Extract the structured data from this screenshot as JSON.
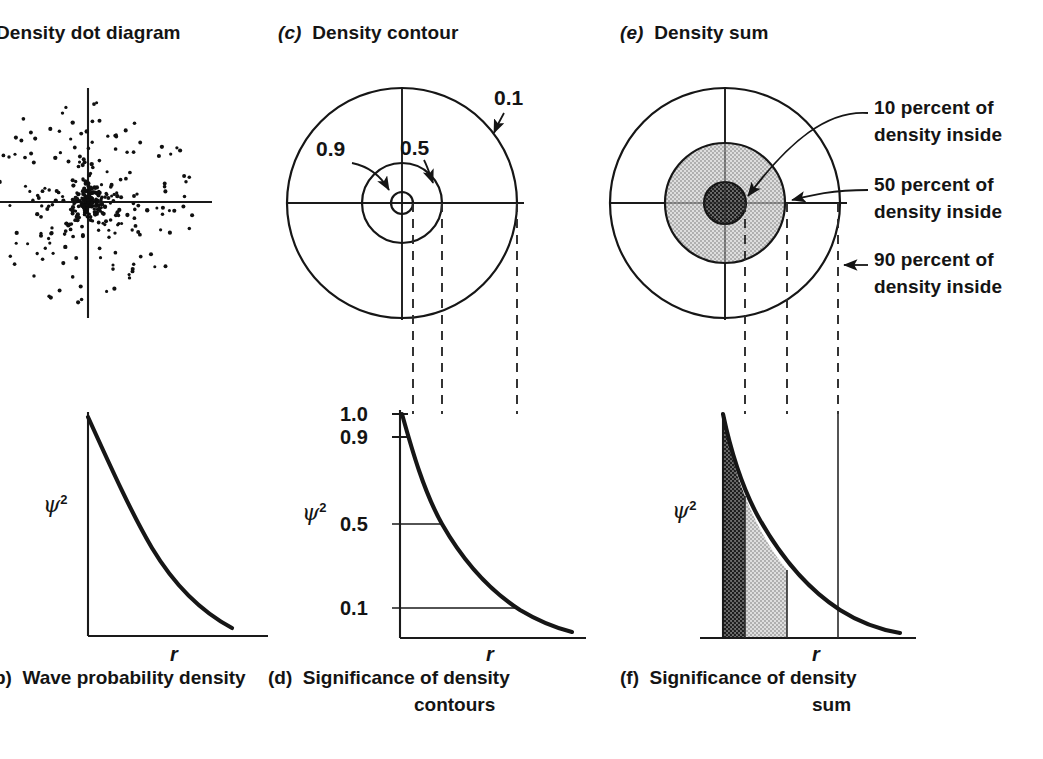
{
  "figure": {
    "panels": [
      {
        "id": "a",
        "tag": "",
        "title": "Density dot diagram",
        "position": "top-left",
        "clipped": true
      },
      {
        "id": "b",
        "tag": "b)",
        "title": "Wave probability density",
        "position": "bottom-left",
        "clipped": true
      },
      {
        "id": "c",
        "tag": "(c)",
        "title": "Density contour",
        "position": "top-middle"
      },
      {
        "id": "d",
        "tag": "(d)",
        "title": "Significance of density",
        "title2": "contours",
        "position": "bottom-middle"
      },
      {
        "id": "e",
        "tag": "(e)",
        "title": "Density sum",
        "position": "top-right"
      },
      {
        "id": "f",
        "tag": "(f)",
        "title": "Significance of density",
        "title2": "sum",
        "position": "bottom-right"
      }
    ]
  },
  "panel_a": {
    "title": "Density dot diagram",
    "axes": {
      "type": "crosshair"
    },
    "dots": {
      "description": "radially decaying random scatter",
      "count": 330
    }
  },
  "panel_b": {
    "tag": "b)",
    "caption": "Wave probability density",
    "y_axis_label": "ψ",
    "y_axis_exponent": "2",
    "x_axis_label": "r"
  },
  "panel_c": {
    "tag": "(c)",
    "title": "Density contour",
    "contour_labels": [
      "0.1",
      "0.5",
      "0.9"
    ],
    "axes": {
      "type": "crosshair"
    }
  },
  "panel_d": {
    "tag": "(d)",
    "caption_line1": "Significance of density",
    "caption_line2": "contours",
    "y_axis_label": "ψ",
    "y_axis_exponent": "2",
    "x_axis_label": "r",
    "y_ticks": [
      "1.0",
      "0.9",
      "0.5",
      "0.1"
    ]
  },
  "panel_e": {
    "tag": "(e)",
    "title": "Density sum",
    "annotations": [
      {
        "id": "inner",
        "line1": "10 percent of",
        "line2": "density inside"
      },
      {
        "id": "middle",
        "line1": "50 percent of",
        "line2": "density inside"
      },
      {
        "id": "outer",
        "line1": "90 percent of",
        "line2": "density inside"
      }
    ],
    "axes": {
      "type": "crosshair"
    }
  },
  "panel_f": {
    "tag": "(f)",
    "caption_line1": "Significance of density",
    "caption_line2": "sum",
    "y_axis_label": "ψ",
    "y_axis_exponent": "2",
    "x_axis_label": "r"
  },
  "chart_data": [
    {
      "type": "line",
      "id": "panel_b_curve",
      "title": "Wave probability density",
      "xlabel": "r",
      "ylabel": "psi^2",
      "grid": false,
      "legend": null,
      "x": [
        0,
        0.1,
        0.2,
        0.3,
        0.4,
        0.5,
        0.6,
        0.7,
        0.8,
        0.9,
        1.0
      ],
      "values": [
        1.0,
        0.78,
        0.6,
        0.46,
        0.35,
        0.27,
        0.2,
        0.15,
        0.11,
        0.08,
        0.06
      ],
      "note": "exponential decay psi^2 = exp(-k r)"
    },
    {
      "type": "line",
      "id": "panel_d_curve",
      "title": "Significance of density contours",
      "xlabel": "r",
      "ylabel": "psi^2",
      "grid": false,
      "ylim": [
        0,
        1.0
      ],
      "ytick_values": [
        1.0,
        0.9,
        0.5,
        0.1
      ],
      "ytick_labels": [
        "1.0",
        "0.9",
        "0.5",
        "0.1"
      ],
      "x": [
        0,
        0.1,
        0.2,
        0.3,
        0.4,
        0.5,
        0.6,
        0.7,
        0.8,
        0.9,
        1.0
      ],
      "values": [
        1.0,
        0.74,
        0.55,
        0.41,
        0.3,
        0.22,
        0.165,
        0.12,
        0.09,
        0.067,
        0.05
      ],
      "markers": [
        {
          "label": "0.9",
          "psi2": 0.9,
          "r_rel": 0.05
        },
        {
          "label": "0.5",
          "psi2": 0.5,
          "r_rel": 0.28
        },
        {
          "label": "0.1",
          "psi2": 0.1,
          "r_rel": 0.87
        }
      ]
    },
    {
      "type": "area",
      "id": "panel_f_curve",
      "title": "Significance of density sum",
      "xlabel": "r",
      "ylabel": "psi^2",
      "grid": false,
      "x": [
        0,
        0.1,
        0.2,
        0.3,
        0.4,
        0.5,
        0.6,
        0.7,
        0.8,
        0.9,
        1.0
      ],
      "values": [
        1.0,
        0.74,
        0.55,
        0.41,
        0.3,
        0.22,
        0.165,
        0.12,
        0.09,
        0.067,
        0.05
      ],
      "regions": [
        {
          "label": "10 percent of density inside",
          "fill": "dark-dotted",
          "r_from": 0.0,
          "r_to": 0.19
        },
        {
          "label": "50 percent of density inside",
          "fill": "light-dotted",
          "r_from": 0.19,
          "r_to": 0.55
        },
        {
          "label": "90 percent of density inside",
          "fill": "none",
          "r_from": 0.55,
          "r_to": 1.0
        }
      ]
    },
    {
      "type": "scatter",
      "id": "panel_a_dots",
      "title": "Density dot diagram",
      "xlabel": "",
      "ylabel": "",
      "grid": false,
      "note": "2-D radially symmetric dot cloud, density falls off with radius"
    },
    {
      "type": "pie",
      "id": "panel_c_contours",
      "title": "Density contour",
      "note": "concentric circles; label = psi^2 value on that contour",
      "categories": [
        "0.9",
        "0.5",
        "0.1"
      ],
      "values": [
        11,
        40,
        115
      ],
      "ylabel": "contour radius (px)"
    },
    {
      "type": "pie",
      "id": "panel_e_sums",
      "title": "Density sum",
      "note": "concentric filled disks; label = cumulative percent of density inside",
      "categories": [
        "10 percent of density inside",
        "50 percent of density inside",
        "90 percent of density inside"
      ],
      "values": [
        10,
        50,
        90
      ],
      "ylabel": "percent of density enclosed"
    }
  ],
  "colors": {
    "ink": "#141414",
    "line": "#1a1a1a",
    "dark_fill": "#3a3a3a",
    "light_fill": "#c9c9c9",
    "background": "#ffffff"
  }
}
